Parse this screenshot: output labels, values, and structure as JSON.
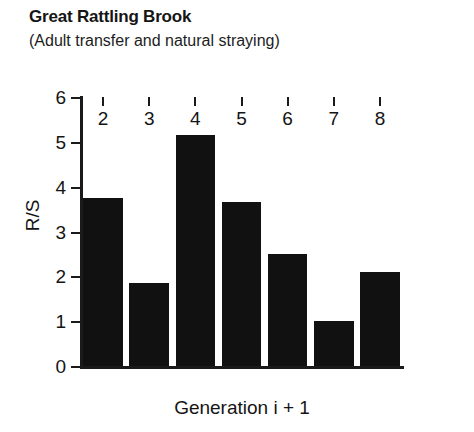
{
  "chart_data": {
    "type": "bar",
    "title": "Great Rattling Brook",
    "subtitle": "(Adult transfer and natural straying)",
    "xlabel": "Generation i + 1",
    "ylabel": "R/S",
    "categories": [
      "2",
      "3",
      "4",
      "5",
      "6",
      "7",
      "8"
    ],
    "values": [
      3.75,
      1.85,
      5.15,
      3.65,
      2.5,
      1.0,
      2.1
    ],
    "ylim": [
      0,
      6
    ],
    "ytick_labels": [
      "0",
      "1",
      "2",
      "3",
      "4",
      "5",
      "6"
    ],
    "ytick_values": [
      0,
      1,
      2,
      3,
      4,
      5,
      6
    ],
    "grid": false,
    "legend": false,
    "bar_color": "#111111",
    "axis_color": "#1a1a1a",
    "background_color": "#ffffff"
  }
}
